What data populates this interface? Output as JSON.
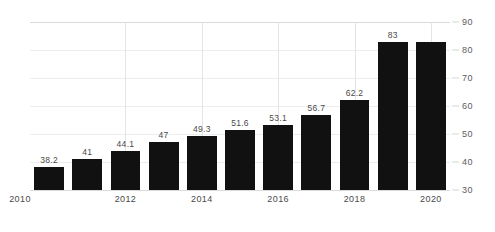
{
  "chart_data": {
    "type": "bar",
    "title": "",
    "subtitle": "",
    "xlabel": "",
    "ylabel": "",
    "categories": [
      "2010",
      "2011",
      "2012",
      "2013",
      "2014",
      "2015",
      "2016",
      "2017",
      "2018",
      "2019",
      "2020"
    ],
    "values": [
      38.2,
      41,
      44.1,
      47,
      49.3,
      51.6,
      53.1,
      56.7,
      62.2,
      83,
      83
    ],
    "data_labels": [
      "38.2",
      "41",
      "44.1",
      "47",
      "49.3",
      "51.6",
      "53.1",
      "56.7",
      "62.2",
      "83",
      ""
    ],
    "ylim": [
      30,
      90
    ],
    "yticks": [
      30,
      40,
      50,
      60,
      70,
      80,
      90
    ],
    "ytick_labels": [
      "30",
      "40",
      "50",
      "60",
      "70",
      "80",
      "90"
    ],
    "xticks_shown": [
      "2010",
      "2012",
      "2014",
      "2016",
      "2018",
      "2020"
    ],
    "grid": "horizontal-and-vertical-faint",
    "legend": "none",
    "y_axis_position": "right",
    "bar_color": "#111111",
    "grid_color": "#eceded",
    "text_color": "#4a4a4a"
  },
  "series_points": [
    {
      "year": "2010",
      "value": 38.2,
      "label": "38.2",
      "xtick": "2010"
    },
    {
      "year": "2011",
      "value": 41,
      "label": "41",
      "xtick": ""
    },
    {
      "year": "2012",
      "value": 44.1,
      "label": "44.1",
      "xtick": "2012"
    },
    {
      "year": "2013",
      "value": 47,
      "label": "47",
      "xtick": ""
    },
    {
      "year": "2014",
      "value": 49.3,
      "label": "49.3",
      "xtick": "2014"
    },
    {
      "year": "2015",
      "value": 51.6,
      "label": "51.6",
      "xtick": ""
    },
    {
      "year": "2016",
      "value": 53.1,
      "label": "53.1",
      "xtick": "2016"
    },
    {
      "year": "2017",
      "value": 56.7,
      "label": "56.7",
      "xtick": ""
    },
    {
      "year": "2018",
      "value": 62.2,
      "label": "62.2",
      "xtick": "2018"
    },
    {
      "year": "2019",
      "value": 83,
      "label": "83",
      "xtick": ""
    },
    {
      "year": "2020",
      "value": 83,
      "label": "",
      "xtick": "2020"
    }
  ]
}
